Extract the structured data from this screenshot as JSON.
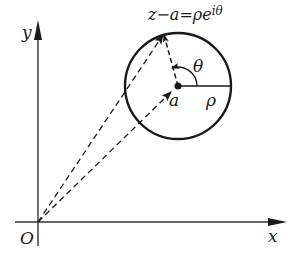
{
  "diagram": {
    "title_formula": "z−a=ρe",
    "title_exponent": "iθ",
    "axes": {
      "x_label": "x",
      "y_label": "y",
      "origin_label": "O"
    },
    "circle": {
      "center_label": "a",
      "radius_label": "ρ",
      "angle_label": "θ"
    },
    "colors": {
      "stroke": "#1a1a1a",
      "axis": "#333333",
      "background": "#ffffff"
    }
  }
}
